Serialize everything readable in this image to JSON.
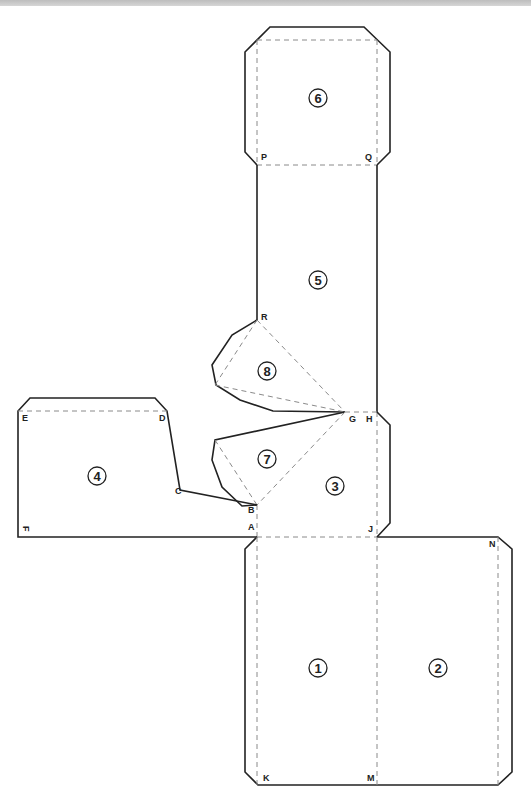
{
  "figure": {
    "panels": [
      {
        "id": "panel-1",
        "label": "1",
        "cx": 318,
        "cy": 668
      },
      {
        "id": "panel-2",
        "label": "2",
        "cx": 438,
        "cy": 668
      },
      {
        "id": "panel-3",
        "label": "3",
        "cx": 335,
        "cy": 486
      },
      {
        "id": "panel-4",
        "label": "4",
        "cx": 97,
        "cy": 476
      },
      {
        "id": "panel-5",
        "label": "5",
        "cx": 318,
        "cy": 280
      },
      {
        "id": "panel-6",
        "label": "6",
        "cx": 318,
        "cy": 98
      },
      {
        "id": "panel-7",
        "label": "7",
        "cx": 267,
        "cy": 459
      },
      {
        "id": "panel-8",
        "label": "8",
        "cx": 267,
        "cy": 371
      }
    ],
    "points": [
      {
        "label": "A",
        "x": 248,
        "y": 530
      },
      {
        "label": "B",
        "x": 248,
        "y": 510
      },
      {
        "label": "C",
        "x": 175,
        "y": 494
      },
      {
        "label": "D",
        "x": 159,
        "y": 421
      },
      {
        "label": "E",
        "x": 22,
        "y": 421
      },
      {
        "label": "F",
        "x": 22,
        "y": 533
      },
      {
        "label": "G",
        "x": 349,
        "y": 421
      },
      {
        "label": "H",
        "x": 366,
        "y": 421
      },
      {
        "label": "J",
        "x": 368,
        "y": 532
      },
      {
        "label": "K",
        "x": 263,
        "y": 780
      },
      {
        "label": "M",
        "x": 367,
        "y": 780
      },
      {
        "label": "N",
        "x": 489,
        "y": 546
      },
      {
        "label": "P",
        "x": 261,
        "y": 159
      },
      {
        "label": "Q",
        "x": 366,
        "y": 159
      },
      {
        "label": "R",
        "x": 261,
        "y": 319
      }
    ]
  },
  "colors": {
    "cut_line": "#222222",
    "fold_line": "#8a8a8a",
    "background": "#ffffff"
  }
}
